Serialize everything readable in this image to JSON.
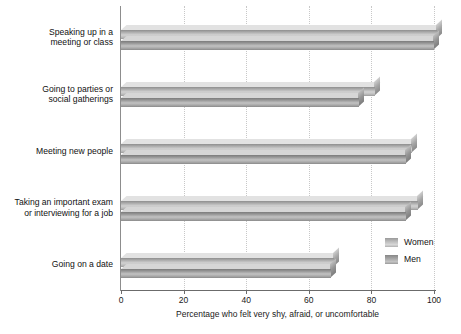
{
  "chart_data": {
    "type": "bar",
    "orientation": "horizontal",
    "title": "",
    "xlabel": "Percentage who felt very shy, afraid, or uncomfortable",
    "ylabel": "",
    "xlim": [
      0,
      105
    ],
    "xticks": [
      0,
      20,
      40,
      60,
      80,
      100
    ],
    "xtick_labels": [
      "0",
      "20",
      "40",
      "60",
      "80",
      "100"
    ],
    "grid": true,
    "grid_axis": "x",
    "legend_position": "bottom-right",
    "categories": [
      "Speaking up in a meeting or class",
      "Going to parties or social gatherings",
      "Meeting new people",
      "Taking an important exam or interviewing for a job",
      "Going on a date"
    ],
    "category_lines": [
      [
        "Speaking up in a",
        "meeting or class"
      ],
      [
        "Going to parties or",
        "social gatherings"
      ],
      [
        "Meeting new people"
      ],
      [
        "Taking an important exam",
        "or interviewing for a job"
      ],
      [
        "Going on a date"
      ]
    ],
    "series": [
      {
        "name": "Women",
        "color": "#d2d2d2",
        "values": [
          101,
          81,
          93,
          95,
          68
        ]
      },
      {
        "name": "Men",
        "color": "#b4b4b4",
        "values": [
          100,
          76,
          91,
          91,
          67
        ]
      }
    ]
  },
  "legend": {
    "items": [
      {
        "label": "Women"
      },
      {
        "label": "Men"
      }
    ]
  },
  "axis": {
    "x_title": "Percentage who felt very shy, afraid, or uncomfortable"
  }
}
